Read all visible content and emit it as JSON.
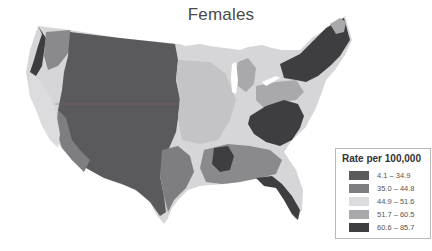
{
  "title": "Females",
  "legend": {
    "title": "Rate per 100,000",
    "classes": [
      {
        "label": "4.1 – 34.9",
        "color": "#5a5a5c"
      },
      {
        "label": "35.0 – 44.8",
        "color": "#7e7e80"
      },
      {
        "label": "44.9 – 51.6",
        "color": "#dcdcde"
      },
      {
        "label": "51.7 – 60.5",
        "color": "#a9a9ab"
      },
      {
        "label": "60.6 – 85.7",
        "color": "#3e3e40"
      }
    ]
  },
  "map": {
    "type": "choropleth",
    "region": "United States (contiguous)",
    "subject": "Females",
    "notable_patterns": [
      {
        "area": "Great Plains / Mountain West",
        "class": "4.1 – 34.9"
      },
      {
        "area": "Pacific Northwest coast",
        "class": "60.6 – 85.7"
      },
      {
        "area": "California",
        "class": "44.9 – 51.6"
      },
      {
        "area": "Northeast / New England",
        "class": "60.6 – 85.7"
      },
      {
        "area": "Virginia / Carolinas",
        "class": "60.6 – 85.7"
      },
      {
        "area": "Florida",
        "class": "60.6 – 85.7"
      },
      {
        "area": "Midwest",
        "class": "44.9 – 51.6"
      },
      {
        "area": "Michigan / Ohio / Pennsylvania",
        "class": "51.7 – 60.5"
      }
    ]
  }
}
